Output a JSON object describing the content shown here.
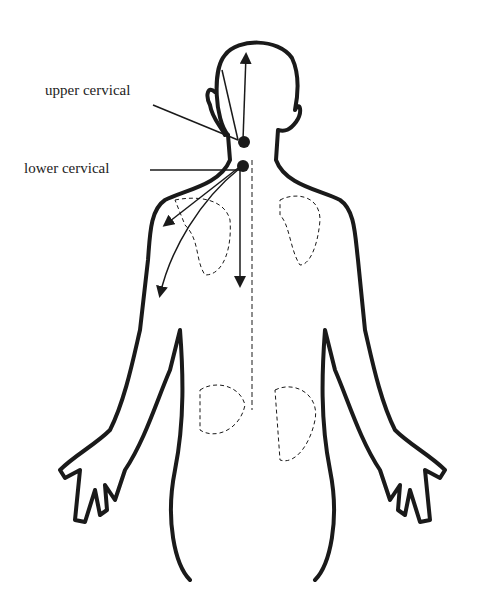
{
  "diagram": {
    "labels": {
      "upper": "upper cervical",
      "lower": "lower cervical"
    },
    "colors": {
      "line": "#1a1a1a",
      "background": "#ffffff"
    }
  }
}
